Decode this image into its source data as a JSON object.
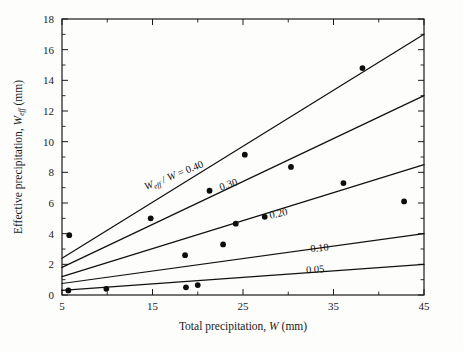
{
  "chart_data": {
    "type": "scatter",
    "title": "",
    "xlabel": "Total precipitation, W (mm)",
    "ylabel": "Effective precipitation, Weff (mm)",
    "xlabel_parts": {
      "prefix": "Total precipitation, ",
      "symbol": "W",
      "suffix": " (mm)"
    },
    "ylabel_parts": {
      "prefix": "Effective precipitation, ",
      "symbol": "W",
      "subscript": "eff",
      "suffix": " (mm)"
    },
    "xlim": [
      5,
      45
    ],
    "ylim": [
      0,
      18
    ],
    "xticks": [
      5,
      15,
      25,
      35,
      45
    ],
    "xtick_labels": [
      "5",
      "15",
      "25",
      "35",
      "45"
    ],
    "xticks_minor": [
      10,
      20,
      30,
      40
    ],
    "yticks": [
      0,
      2,
      4,
      6,
      8,
      10,
      12,
      14,
      16,
      18
    ],
    "ytick_labels": [
      "0",
      "2",
      "4",
      "6",
      "8",
      "10",
      "12",
      "14",
      "16",
      "18"
    ],
    "yticks_minor": [
      1,
      3,
      5,
      7,
      9,
      11,
      13,
      15,
      17
    ],
    "grid": false,
    "legend": "inline-curve-labels",
    "series": [
      {
        "name": "Observed effective precipitation",
        "marker": "filled-circle",
        "points": [
          {
            "x": 5.7,
            "y": 0.3
          },
          {
            "x": 5.8,
            "y": 3.9
          },
          {
            "x": 9.9,
            "y": 0.4
          },
          {
            "x": 14.8,
            "y": 5.0
          },
          {
            "x": 18.6,
            "y": 2.6
          },
          {
            "x": 18.7,
            "y": 0.5
          },
          {
            "x": 20.0,
            "y": 0.65
          },
          {
            "x": 21.3,
            "y": 6.8
          },
          {
            "x": 22.8,
            "y": 3.3
          },
          {
            "x": 24.2,
            "y": 4.65
          },
          {
            "x": 25.2,
            "y": 9.15
          },
          {
            "x": 27.4,
            "y": 5.1
          },
          {
            "x": 30.3,
            "y": 8.35
          },
          {
            "x": 36.1,
            "y": 7.3
          },
          {
            "x": 38.2,
            "y": 14.8
          },
          {
            "x": 42.8,
            "y": 6.1
          }
        ]
      }
    ],
    "lines": [
      {
        "ratio": "0.40",
        "label": "Weff / W = 0.40",
        "x0": 5,
        "y0": 2.4,
        "x1": 45,
        "y1": 17.0
      },
      {
        "ratio": "0.30",
        "label": "0.30",
        "x0": 5,
        "y0": 1.8,
        "x1": 45,
        "y1": 13.0
      },
      {
        "ratio": "0.20",
        "label": "0.20",
        "x0": 5,
        "y0": 1.2,
        "x1": 45,
        "y1": 8.5
      },
      {
        "ratio": "0.10",
        "label": "0.10",
        "x0": 5,
        "y0": 0.75,
        "x1": 45,
        "y1": 4.0
      },
      {
        "ratio": "0.05",
        "label": "0.05",
        "x0": 5,
        "y0": 0.3,
        "x1": 45,
        "y1": 2.0
      }
    ],
    "annotations": [
      {
        "text": "Weff / W = 0.40",
        "x": 17.5,
        "y": 7.6,
        "rotation": -22
      },
      {
        "text": "0.30",
        "x": 23.5,
        "y": 7.0,
        "rotation": -19
      },
      {
        "text": "0.20",
        "x": 29.0,
        "y": 5.1,
        "rotation": -13
      },
      {
        "text": "0.10",
        "x": 33.5,
        "y": 2.85,
        "rotation": -6
      },
      {
        "text": "0.05",
        "x": 33.0,
        "y": 1.45,
        "rotation": -3
      }
    ],
    "colors": {
      "axis": "#1a1a1a",
      "line": "#111111",
      "marker": "#0d0d0d",
      "background": "#fdfdfc"
    }
  }
}
